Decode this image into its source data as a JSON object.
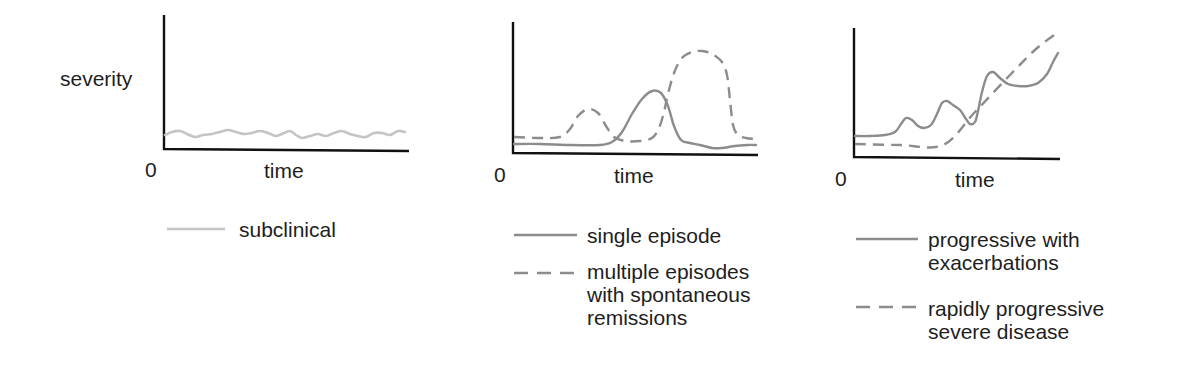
{
  "figure": {
    "y_label": "severity",
    "colors": {
      "axis": "#111111",
      "subclinical": "#c4c4c4",
      "series": "#8c8c8c",
      "text": "#1e1e1e"
    }
  },
  "chart_data": [
    {
      "type": "line",
      "title": "",
      "xlabel": "time",
      "ylabel": "severity",
      "origin_label": "0",
      "grid": false,
      "legend_position": "below",
      "frame": {
        "x0": 164,
        "y0": 149,
        "x1": 409,
        "ytop": 15
      },
      "series": [
        {
          "name": "subclinical",
          "style": "solid",
          "color": "#c4c4c4",
          "points": [
            [
              165,
              135
            ],
            [
              172,
              132
            ],
            [
              180,
              131
            ],
            [
              187,
              134
            ],
            [
              195,
              137
            ],
            [
              203,
              135
            ],
            [
              212,
              134
            ],
            [
              220,
              132
            ],
            [
              228,
              130
            ],
            [
              236,
              132
            ],
            [
              244,
              134
            ],
            [
              252,
              133
            ],
            [
              260,
              131
            ],
            [
              268,
              133
            ],
            [
              276,
              136
            ],
            [
              284,
              133
            ],
            [
              290,
              131
            ],
            [
              296,
              135
            ],
            [
              302,
              138
            ],
            [
              310,
              136
            ],
            [
              318,
              134
            ],
            [
              326,
              136
            ],
            [
              334,
              133
            ],
            [
              342,
              131
            ],
            [
              350,
              134
            ],
            [
              358,
              136
            ],
            [
              366,
              137
            ],
            [
              374,
              133
            ],
            [
              382,
              133
            ],
            [
              390,
              135
            ],
            [
              398,
              131
            ],
            [
              405,
              132
            ]
          ]
        }
      ],
      "legend": [
        {
          "label": "subclinical",
          "style": "solid",
          "color": "#c4c4c4"
        }
      ]
    },
    {
      "type": "line",
      "title": "",
      "xlabel": "time",
      "ylabel": "",
      "origin_label": "0",
      "grid": false,
      "legend_position": "below",
      "frame": {
        "x0": 513,
        "y0": 153,
        "x1": 758,
        "ytop": 22
      },
      "series": [
        {
          "name": "single episode",
          "style": "solid",
          "color": "#8c8c8c",
          "points": [
            [
              514,
              144
            ],
            [
              540,
              144
            ],
            [
              570,
              145
            ],
            [
              600,
              145
            ],
            [
              612,
              142
            ],
            [
              622,
              132
            ],
            [
              632,
              114
            ],
            [
              642,
              99
            ],
            [
              652,
              91
            ],
            [
              661,
              93
            ],
            [
              668,
              106
            ],
            [
              674,
              126
            ],
            [
              681,
              140
            ],
            [
              690,
              143
            ],
            [
              700,
              145
            ],
            [
              712,
              148
            ],
            [
              722,
              148
            ],
            [
              735,
              146
            ],
            [
              748,
              145
            ],
            [
              756,
              145
            ]
          ]
        },
        {
          "name": "multiple episodes with spontaneous remissions",
          "style": "dashed",
          "color": "#8c8c8c",
          "points": [
            [
              514,
              137
            ],
            [
              540,
              138
            ],
            [
              560,
              137
            ],
            [
              570,
              129
            ],
            [
              578,
              116
            ],
            [
              588,
              109
            ],
            [
              598,
              113
            ],
            [
              606,
              126
            ],
            [
              614,
              137
            ],
            [
              625,
              141
            ],
            [
              640,
              141
            ],
            [
              652,
              138
            ],
            [
              659,
              128
            ],
            [
              664,
              112
            ],
            [
              668,
              94
            ],
            [
              674,
              73
            ],
            [
              682,
              58
            ],
            [
              692,
              52
            ],
            [
              702,
              51
            ],
            [
              712,
              54
            ],
            [
              722,
              62
            ],
            [
              727,
              75
            ],
            [
              730,
              100
            ],
            [
              733,
              125
            ],
            [
              738,
              135
            ],
            [
              746,
              138
            ],
            [
              756,
              139
            ]
          ]
        }
      ],
      "legend": [
        {
          "label": "single episode",
          "style": "solid",
          "color": "#8c8c8c"
        },
        {
          "label": "multiple episodes with spontaneous remissions",
          "lines": [
            "multiple episodes",
            "with spontaneous",
            "remissions"
          ],
          "style": "dashed",
          "color": "#8c8c8c"
        }
      ]
    },
    {
      "type": "line",
      "title": "",
      "xlabel": "time",
      "ylabel": "",
      "origin_label": "0",
      "grid": false,
      "legend_position": "below",
      "frame": {
        "x0": 854,
        "y0": 157,
        "x1": 1060,
        "ytop": 28
      },
      "series": [
        {
          "name": "progressive with exacerbations",
          "style": "solid",
          "color": "#8c8c8c",
          "points": [
            [
              855,
              136
            ],
            [
              870,
              136
            ],
            [
              885,
              135
            ],
            [
              895,
              132
            ],
            [
              901,
              124
            ],
            [
              906,
              118
            ],
            [
              912,
              120
            ],
            [
              918,
              126
            ],
            [
              924,
              128
            ],
            [
              931,
              125
            ],
            [
              937,
              114
            ],
            [
              942,
              103
            ],
            [
              947,
              101
            ],
            [
              953,
              105
            ],
            [
              960,
              110
            ],
            [
              966,
              119
            ],
            [
              970,
              124
            ],
            [
              975,
              122
            ],
            [
              978,
              111
            ],
            [
              982,
              92
            ],
            [
              987,
              76
            ],
            [
              993,
              72
            ],
            [
              1000,
              78
            ],
            [
              1008,
              84
            ],
            [
              1018,
              86
            ],
            [
              1028,
              86
            ],
            [
              1038,
              83
            ],
            [
              1047,
              74
            ],
            [
              1053,
              62
            ],
            [
              1058,
              53
            ]
          ]
        },
        {
          "name": "rapidly progressive severe disease",
          "style": "dashed",
          "color": "#8c8c8c",
          "points": [
            [
              855,
              144
            ],
            [
              900,
              145
            ],
            [
              943,
              145
            ],
            [
              975,
              112
            ],
            [
              1010,
              75
            ],
            [
              1036,
              49
            ],
            [
              1057,
              33
            ]
          ]
        }
      ],
      "legend": [
        {
          "label": "progressive with exacerbations",
          "lines": [
            "progressive with",
            "exacerbations"
          ],
          "style": "solid",
          "color": "#8c8c8c"
        },
        {
          "label": "rapidly progressive severe disease",
          "lines": [
            "rapidly progressive",
            "severe disease"
          ],
          "style": "dashed",
          "color": "#8c8c8c"
        }
      ]
    }
  ],
  "labels": {
    "chart1": {
      "origin": "0",
      "xlabel": "time",
      "legend_0": "subclinical"
    },
    "chart2": {
      "origin": "0",
      "xlabel": "time",
      "legend_0": "single episode",
      "legend_1_l1": "multiple episodes",
      "legend_1_l2": "with spontaneous",
      "legend_1_l3": "remissions"
    },
    "chart3": {
      "origin": "0",
      "xlabel": "time",
      "legend_0_l1": "progressive with",
      "legend_0_l2": "exacerbations",
      "legend_1_l1": "rapidly progressive",
      "legend_1_l2": "severe disease"
    }
  }
}
